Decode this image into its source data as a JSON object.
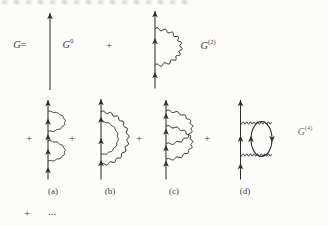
{
  "figure": {
    "lhs": "G",
    "equals": "=",
    "plus": "+",
    "ellipsis": "...",
    "terms": {
      "g0": {
        "base": "G",
        "sup": "0"
      },
      "g2": {
        "base": "G",
        "sup": "(2)"
      },
      "g4": {
        "base": "G",
        "sup": "(4)"
      }
    },
    "diagram_labels": [
      "(a)",
      "(b)",
      "(c)",
      "(d)"
    ],
    "colors": {
      "ink": "#2e2e2e",
      "background": "#fcfcfb"
    }
  }
}
